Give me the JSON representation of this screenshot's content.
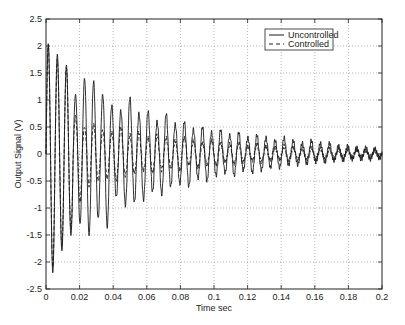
{
  "chart_data": {
    "type": "line",
    "title": "",
    "xlabel": "Time sec",
    "ylabel": "Output Signal (V)",
    "xlim": [
      0,
      0.2
    ],
    "ylim": [
      -2.5,
      2.5
    ],
    "xticks": [
      0,
      0.02,
      0.04,
      0.06,
      0.08,
      0.1,
      0.12,
      0.14,
      0.16,
      0.18,
      0.2
    ],
    "xtick_labels": [
      "0",
      "0.02",
      "0.04",
      "0.06",
      "0.08",
      "0.1",
      "0.12",
      "0.14",
      "0.16",
      "0.18",
      "0.2"
    ],
    "yticks": [
      -2.5,
      -2,
      -1.5,
      -1,
      -0.5,
      0,
      0.5,
      1,
      1.5,
      2,
      2.5
    ],
    "ytick_labels": [
      "-2.5",
      "-2",
      "-1.5",
      "-1",
      "-0.5",
      "0",
      "0.5",
      "1",
      "1.5",
      "2",
      "2.5"
    ],
    "grid": true,
    "legend_position": "upper right",
    "oscillation_period_sec": 0.0054,
    "series": [
      {
        "name": "Uncontrolled",
        "style": "solid",
        "positive_peaks": [
          2.05,
          1.85,
          1.65,
          1.1,
          1.4,
          1.35,
          1.1,
          0.9,
          0.8,
          1.05,
          0.75,
          0.8,
          0.6,
          0.75,
          0.55,
          0.6,
          0.45,
          0.5,
          0.4,
          0.45,
          0.35,
          0.4,
          0.3,
          0.35,
          0.3,
          0.25,
          0.3,
          0.25,
          0.2,
          0.25,
          0.2,
          0.2,
          0.15,
          0.15,
          0.12,
          0.12,
          0.1
        ],
        "negative_peaks": [
          -2.2,
          -1.8,
          -1.5,
          -1.3,
          -1.5,
          -1.2,
          -1.35,
          -0.8,
          -0.95,
          -0.9,
          -0.85,
          -0.7,
          -0.75,
          -0.6,
          -0.55,
          -0.6,
          -0.45,
          -0.5,
          -0.4,
          -0.35,
          -0.4,
          -0.3,
          -0.35,
          -0.3,
          -0.25,
          -0.25,
          -0.2,
          -0.2,
          -0.18,
          -0.15,
          -0.15,
          -0.12,
          -0.12,
          -0.1,
          -0.1,
          -0.1,
          -0.08
        ]
      },
      {
        "name": "Controlled",
        "style": "dashed",
        "positive_peaks": [
          2.0,
          1.75,
          1.6,
          0.7,
          0.5,
          0.55,
          0.45,
          0.4,
          0.5,
          0.35,
          0.4,
          0.3,
          0.35,
          0.3,
          0.25,
          0.3,
          0.25,
          0.2,
          0.25,
          0.2,
          0.18,
          0.2,
          0.15,
          0.18,
          0.15,
          0.12,
          0.15,
          0.12,
          0.1,
          0.12,
          0.1,
          0.1,
          0.08,
          0.08,
          0.08,
          0.06,
          0.06
        ],
        "negative_peaks": [
          -2.1,
          -1.7,
          -1.4,
          -0.9,
          -0.6,
          -0.5,
          -0.45,
          -0.5,
          -0.4,
          -0.35,
          -0.3,
          -0.35,
          -0.3,
          -0.25,
          -0.3,
          -0.2,
          -0.25,
          -0.2,
          -0.2,
          -0.15,
          -0.18,
          -0.15,
          -0.12,
          -0.15,
          -0.12,
          -0.1,
          -0.12,
          -0.1,
          -0.1,
          -0.08,
          -0.08,
          -0.08,
          -0.06,
          -0.06,
          -0.05,
          -0.05,
          -0.05
        ]
      }
    ]
  },
  "legend": {
    "items": [
      {
        "label": "Uncontrolled",
        "style": "solid"
      },
      {
        "label": "Controlled",
        "style": "dashed"
      }
    ]
  },
  "colors": {
    "line": "#1a1a1a",
    "grid": "#9a9a9a",
    "axis": "#222222",
    "background": "#ffffff"
  }
}
